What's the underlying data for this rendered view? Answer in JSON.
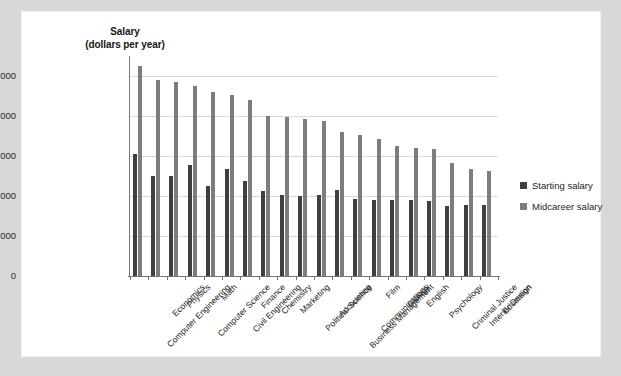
{
  "chart_data": {
    "type": "bar",
    "title": "",
    "ylabel_line1": "Salary",
    "ylabel_line2": "(dollars per year)",
    "xlabel": "",
    "ylim": [
      0,
      110000
    ],
    "grid": true,
    "legend_position": "right",
    "ytick_labels": [
      "$100,000",
      "80,000",
      "60,000",
      "40,000",
      "20,000",
      "0"
    ],
    "ytick_values": [
      100000,
      80000,
      60000,
      40000,
      20000,
      0
    ],
    "categories": [
      "Computer Engineering",
      "Economics",
      "Physics",
      "Computer Science",
      "Math",
      "Civil Engineering",
      "Finance",
      "Chemistry",
      "Marketing",
      "Political Science",
      "Accounting",
      "Business Management",
      "Communications",
      "Film",
      "Biology",
      "English",
      "Psychology",
      "Criminal Justice",
      "Interior Design",
      "Education"
    ],
    "series": [
      {
        "name": "Starting salary",
        "color": "#3f3f3f",
        "values": [
          61000,
          50000,
          50000,
          55500,
          45000,
          53500,
          47500,
          42500,
          40500,
          40000,
          40500,
          43000,
          38500,
          38000,
          38000,
          38000,
          37500,
          35000,
          35500,
          35500
        ]
      },
      {
        "name": "Midcareer salary",
        "color": "#7d7d7d",
        "values": [
          105000,
          98000,
          97000,
          95000,
          92000,
          90500,
          88000,
          80000,
          79500,
          78500,
          77500,
          72000,
          70500,
          68500,
          65000,
          64000,
          63500,
          56500,
          53500,
          52500
        ]
      }
    ]
  },
  "legend": {
    "items": [
      {
        "label": "Starting salary",
        "color": "#3f3f3f"
      },
      {
        "label": "Midcareer salary",
        "color": "#7d7d7d"
      }
    ]
  }
}
